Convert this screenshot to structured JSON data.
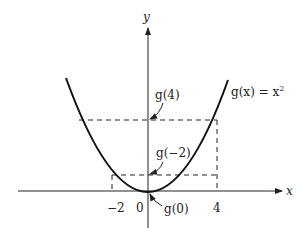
{
  "diagram": {
    "function_label": "g(x) = x",
    "function_exponent": "2",
    "axes": {
      "x_label": "x",
      "y_label": "y"
    },
    "ticks": [
      {
        "label": "−2",
        "x_value": -2
      },
      {
        "label": "0",
        "x_value": 0
      },
      {
        "label": "4",
        "x_value": 4
      }
    ],
    "annotations": [
      {
        "label": "g(4)",
        "points_to": [
          0,
          16
        ]
      },
      {
        "label": "g(−2)",
        "points_to": [
          0,
          4
        ]
      },
      {
        "label": "g(0)",
        "points_to": [
          0,
          0
        ]
      }
    ],
    "colors": {
      "ink": "#222222",
      "background": "#ffffff"
    }
  }
}
